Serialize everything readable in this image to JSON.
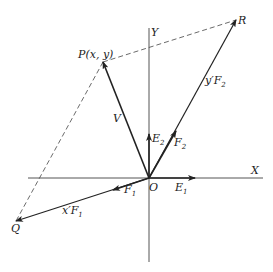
{
  "labels": {
    "P": "P(x, y)",
    "R": "R",
    "Q": "Q",
    "O": "O",
    "X": "X",
    "Y": "Y",
    "V": "V",
    "E1_main": "E",
    "E1_sub": "1",
    "E2_main": "E",
    "E2_sub": "2",
    "F1_main": "F",
    "F1_sub": "1",
    "F2_main": "F",
    "F2_sub": "2",
    "xF1_main": "x′F",
    "xF1_sub": "1",
    "yF2_main": "y′F",
    "yF2_sub": "2"
  },
  "colors": {
    "line": "#222222",
    "axis": "#555555",
    "background": "#ffffff"
  }
}
